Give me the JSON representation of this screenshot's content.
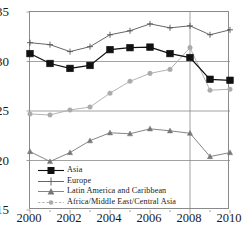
{
  "chart_data": {
    "type": "line",
    "title": "",
    "subtitle": "",
    "xlabel": "",
    "ylabel": "",
    "x": [
      2000,
      2001,
      2002,
      2003,
      2004,
      2005,
      2006,
      2007,
      2008,
      2009,
      2010
    ],
    "xlim": [
      2000,
      2010
    ],
    "ylim": [
      15,
      35
    ],
    "yticks": [
      15,
      20,
      25,
      30,
      35
    ],
    "xticks": [
      2000,
      2002,
      2004,
      2006,
      2008,
      2010
    ],
    "xtick_labels": [
      "2000",
      "2002",
      "2004",
      "2006",
      "2008",
      "2010"
    ],
    "ytick_labels": [
      "35",
      "30",
      "25",
      "20",
      "15"
    ],
    "x_minor_ticks": [
      2001,
      2003,
      2005,
      2007,
      2009
    ],
    "grid": "horizontal gridlines at 20, 25, 30 plus vertical reference line at 2008",
    "gridlines_y": [
      20,
      25,
      30
    ],
    "reference_line_x": 2008,
    "legend_position": "inside lower-left",
    "series": [
      {
        "name": "Asia",
        "marker": "filled-square",
        "color": "#111111",
        "values": [
          30.8,
          29.8,
          29.3,
          29.6,
          31.2,
          31.4,
          31.45,
          30.8,
          30.4,
          28.2,
          28.1
        ]
      },
      {
        "name": "Europe",
        "marker": "plus",
        "color": "#555555",
        "values": [
          31.9,
          31.7,
          31.0,
          31.5,
          32.7,
          33.1,
          33.8,
          33.4,
          33.6,
          32.7,
          33.2
        ]
      },
      {
        "name": "Latin America and Caribbean",
        "marker": "filled-triangle",
        "color": "#777777",
        "values": [
          20.9,
          19.9,
          20.8,
          22.0,
          22.8,
          22.7,
          23.2,
          23.0,
          22.75,
          20.4,
          20.8
        ]
      },
      {
        "name": "Africa/Middle East/Central Asia",
        "marker": "filled-circle",
        "color": "#aaaaaa",
        "values": [
          24.7,
          24.6,
          25.1,
          25.4,
          26.8,
          28.0,
          28.8,
          29.2,
          31.4,
          27.1,
          27.2
        ]
      }
    ]
  },
  "legend": {
    "items": [
      {
        "label": "Asia",
        "marker": "filled-square-icon"
      },
      {
        "label": "Europe",
        "marker": "plus-icon"
      },
      {
        "label": "Latin America and Caribbean",
        "marker": "filled-triangle-icon"
      },
      {
        "label": "Africa/Middle East/Central Asia",
        "marker": "filled-circle-icon"
      }
    ]
  },
  "axes": {
    "y_labels": [
      "35",
      "30",
      "25",
      "20",
      "15"
    ],
    "x_labels": [
      "2000",
      "2002",
      "2004",
      "2006",
      "2008",
      "2010"
    ]
  },
  "colors": {
    "axis": "#8a8a8a",
    "grid": "#8a8a8a",
    "asia": "#111111",
    "europe": "#555555",
    "latin_america": "#777777",
    "africa": "#aaaaaa",
    "background": "#ffffff"
  }
}
